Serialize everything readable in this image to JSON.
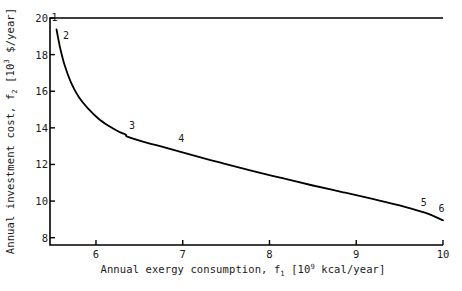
{
  "chart_data": {
    "type": "line",
    "title": "",
    "subtitle": "",
    "xlabel_plain": "Annual exergy consumption, f1 [10^9 kcal/year]",
    "ylabel_plain": "Annual investment cost, f2 [10^3 $/year]",
    "xlabel_parts": {
      "pre": "Annual exergy consumption, f",
      "sub": "1",
      "mid": "  [10",
      "sup": "9",
      "post": " kcal/year]"
    },
    "ylabel_parts": {
      "pre": "Annual investment cost, f",
      "sub": "2",
      "mid": "  [10",
      "sup": "3",
      "post": " $/year]"
    },
    "xlim": [
      5.47,
      10.0
    ],
    "ylim": [
      7.6,
      20.0
    ],
    "xticks": [
      6,
      7,
      8,
      9,
      10
    ],
    "yticks": [
      8,
      10,
      12,
      14,
      16,
      18,
      20
    ],
    "xtick_labels": [
      "6",
      "7",
      "8",
      "9",
      "10"
    ],
    "ytick_labels": [
      "8",
      "10",
      "12",
      "14",
      "16",
      "18",
      "20"
    ],
    "grid": false,
    "legend": false,
    "legend_position": "none",
    "line_color": "#000000",
    "line_width_px": 1.8,
    "frame_color": "#000000",
    "series": [
      {
        "name": "Pareto frontier",
        "x": [
          5.545,
          5.56,
          5.59,
          5.64,
          5.71,
          5.8,
          5.91,
          6.03,
          6.15,
          6.26,
          6.345,
          6.36,
          6.56,
          6.8,
          7.1,
          7.45,
          7.8,
          8.15,
          8.5,
          8.85,
          9.2,
          9.55,
          9.8,
          10.0
        ],
        "y": [
          19.38,
          19.0,
          18.3,
          17.4,
          16.5,
          15.7,
          15.05,
          14.5,
          14.1,
          13.8,
          13.62,
          13.52,
          13.22,
          12.92,
          12.52,
          12.08,
          11.65,
          11.25,
          10.85,
          10.48,
          10.1,
          9.7,
          9.35,
          8.95
        ]
      }
    ],
    "annotations": [
      {
        "label": "1",
        "x": 5.545,
        "y": 19.38,
        "dx_px": -2,
        "dy_px": -11
      },
      {
        "label": "2",
        "x": 5.575,
        "y": 18.8,
        "dx_px": 7,
        "dy_px": -4
      },
      {
        "label": "3",
        "x": 6.345,
        "y": 13.62,
        "dx_px": 6,
        "dy_px": -9
      },
      {
        "label": "4",
        "x": 6.96,
        "y": 12.82,
        "dx_px": 2,
        "dy_px": -10
      },
      {
        "label": "5",
        "x": 9.8,
        "y": 9.35,
        "dx_px": -2,
        "dy_px": -10
      },
      {
        "label": "6",
        "x": 9.96,
        "y": 9.02,
        "dx_px": 2,
        "dy_px": -10
      }
    ]
  }
}
